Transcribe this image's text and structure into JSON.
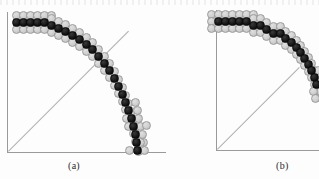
{
  "figure": {
    "type": "raster-circle-illustration",
    "background_color": "#fdfdfd",
    "colors": {
      "chosen_pixel": "#111111",
      "candidate_pixel": "#cfcfcf",
      "candidate_outline": "#9b9b9b",
      "axis": "#9a9a9a",
      "diagonal": "#b0b0b0",
      "caption_text": "#2b2b2b"
    },
    "panels": [
      {
        "id": "a",
        "caption": "(a)",
        "origin": {
          "x": 7,
          "y": 152
        },
        "axis_vertical": {
          "x": 7,
          "top": 12,
          "bottom": 152
        },
        "axis_horizontal": {
          "y": 152,
          "left": 7,
          "right": 166
        },
        "diagonal_line": {
          "x1": 8,
          "y1": 151,
          "x2": 128,
          "y2": 31
        },
        "cell_size": 9,
        "cell_pitch": 7.2,
        "chosen_cells": [
          [
            12,
            18
          ],
          [
            19,
            18
          ],
          [
            26,
            18
          ],
          [
            33,
            18
          ],
          [
            40,
            18
          ],
          [
            47,
            21
          ],
          [
            54,
            24
          ],
          [
            61,
            27
          ],
          [
            68,
            31
          ],
          [
            75,
            35
          ],
          [
            82,
            40
          ],
          [
            88,
            45
          ],
          [
            94,
            52
          ],
          [
            100,
            59
          ],
          [
            105,
            66
          ],
          [
            110,
            74
          ],
          [
            114,
            82
          ],
          [
            118,
            90
          ],
          [
            121,
            98
          ],
          [
            124,
            106
          ],
          [
            127,
            114
          ],
          [
            129,
            122
          ],
          [
            131,
            130
          ],
          [
            132,
            138
          ],
          [
            133,
            146
          ]
        ],
        "candidate_cells": [
          [
            12,
            11
          ],
          [
            19,
            11
          ],
          [
            26,
            11
          ],
          [
            33,
            11
          ],
          [
            40,
            11
          ],
          [
            47,
            11
          ],
          [
            12,
            25
          ],
          [
            19,
            25
          ],
          [
            26,
            25
          ],
          [
            33,
            25
          ],
          [
            40,
            25
          ],
          [
            47,
            28
          ],
          [
            47,
            14
          ],
          [
            54,
            17
          ],
          [
            61,
            20
          ],
          [
            68,
            24
          ],
          [
            75,
            28
          ],
          [
            54,
            31
          ],
          [
            61,
            34
          ],
          [
            68,
            38
          ],
          [
            75,
            42
          ],
          [
            82,
            47
          ],
          [
            82,
            33
          ],
          [
            88,
            38
          ],
          [
            94,
            45
          ],
          [
            100,
            52
          ],
          [
            88,
            52
          ],
          [
            94,
            59
          ],
          [
            100,
            66
          ],
          [
            105,
            73
          ],
          [
            105,
            59
          ],
          [
            110,
            67
          ],
          [
            114,
            75
          ],
          [
            118,
            83
          ],
          [
            110,
            81
          ],
          [
            114,
            89
          ],
          [
            118,
            97
          ],
          [
            121,
            105
          ],
          [
            121,
            91
          ],
          [
            124,
            99
          ],
          [
            127,
            107
          ],
          [
            129,
            115
          ],
          [
            124,
            113
          ],
          [
            127,
            121
          ],
          [
            129,
            129
          ],
          [
            131,
            137
          ],
          [
            131,
            123
          ],
          [
            132,
            131
          ],
          [
            133,
            139
          ],
          [
            134,
            147
          ],
          [
            125,
            146
          ],
          [
            140,
            146
          ],
          [
            139,
            138
          ],
          [
            138,
            130
          ],
          [
            136,
            122
          ],
          [
            134,
            114
          ],
          [
            133,
            106
          ],
          [
            131,
            98
          ],
          [
            136,
            138
          ],
          [
            142,
            121
          ],
          [
            124,
            122
          ],
          [
            122,
            114
          ]
        ]
      },
      {
        "id": "b",
        "caption": "(b)",
        "origin": {
          "x": 216,
          "y": 150
        },
        "axis_vertical": {
          "x": 216,
          "top": 10,
          "bottom": 150
        },
        "axis_horizontal": {
          "y": 150,
          "left": 216,
          "right": 319
        },
        "diagonal_line": {
          "x1": 217,
          "y1": 149,
          "x2": 299,
          "y2": 67
        },
        "cell_size": 9,
        "cell_pitch": 7.2,
        "chosen_cells": [
          [
            214,
            17
          ],
          [
            221,
            17
          ],
          [
            228,
            17
          ],
          [
            235,
            17
          ],
          [
            242,
            17
          ],
          [
            249,
            21
          ],
          [
            256,
            21
          ],
          [
            262,
            25
          ],
          [
            269,
            29
          ],
          [
            276,
            29
          ],
          [
            281,
            34
          ],
          [
            287,
            38
          ],
          [
            292,
            43
          ],
          [
            296,
            48
          ],
          [
            300,
            54
          ],
          [
            304,
            60
          ],
          [
            307,
            66
          ],
          [
            310,
            73
          ],
          [
            312,
            80
          ]
        ],
        "candidate_cells": [
          [
            207,
            10
          ],
          [
            214,
            10
          ],
          [
            221,
            10
          ],
          [
            228,
            10
          ],
          [
            235,
            10
          ],
          [
            242,
            10
          ],
          [
            249,
            10
          ],
          [
            207,
            17
          ],
          [
            207,
            24
          ],
          [
            214,
            24
          ],
          [
            221,
            24
          ],
          [
            228,
            24
          ],
          [
            235,
            24
          ],
          [
            242,
            24
          ],
          [
            249,
            28
          ],
          [
            249,
            14
          ],
          [
            256,
            14
          ],
          [
            262,
            18
          ],
          [
            256,
            28
          ],
          [
            262,
            32
          ],
          [
            269,
            36
          ],
          [
            276,
            36
          ],
          [
            269,
            22
          ],
          [
            276,
            22
          ],
          [
            281,
            27
          ],
          [
            281,
            41
          ],
          [
            287,
            45
          ],
          [
            292,
            50
          ],
          [
            287,
            31
          ],
          [
            292,
            36
          ],
          [
            296,
            41
          ],
          [
            296,
            55
          ],
          [
            300,
            61
          ],
          [
            304,
            67
          ],
          [
            300,
            47
          ],
          [
            304,
            53
          ],
          [
            307,
            59
          ],
          [
            307,
            73
          ],
          [
            310,
            80
          ],
          [
            312,
            87
          ],
          [
            310,
            66
          ],
          [
            312,
            73
          ],
          [
            314,
            80
          ],
          [
            314,
            66
          ],
          [
            316,
            73
          ],
          [
            316,
            87
          ],
          [
            309,
            87
          ],
          [
            311,
            94
          ]
        ]
      }
    ]
  }
}
